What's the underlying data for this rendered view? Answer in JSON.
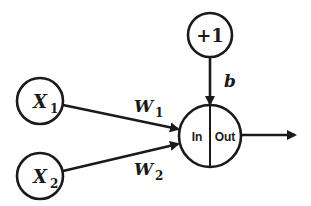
{
  "diagram": {
    "type": "single-neuron / perceptron",
    "nodes": {
      "x1": {
        "label": "X",
        "subscript": "1"
      },
      "x2": {
        "label": "X",
        "subscript": "2"
      },
      "bias": {
        "label": "+1"
      },
      "neuron": {
        "in_label": "In",
        "out_label": "Out"
      }
    },
    "edges": {
      "w1": {
        "label": "W",
        "subscript": "1",
        "from": "x1",
        "to": "neuron"
      },
      "w2": {
        "label": "W",
        "subscript": "2",
        "from": "x2",
        "to": "neuron"
      },
      "b": {
        "label": "b",
        "from": "bias",
        "to": "neuron"
      },
      "output": {
        "from": "neuron",
        "to": ""
      }
    },
    "colors": {
      "stroke": "#1a1a1a",
      "background": "#ffffff"
    }
  }
}
